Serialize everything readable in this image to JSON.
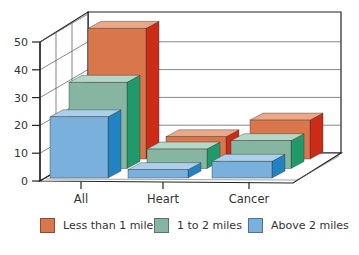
{
  "chart_data": {
    "type": "bar",
    "subtype": "3d-grouped",
    "title": "",
    "xlabel": "",
    "ylabel": "",
    "categories": [
      "All",
      "Heart",
      "Cancer"
    ],
    "y_ticks": [
      0,
      10,
      20,
      30,
      40,
      50
    ],
    "ylim": [
      0,
      50
    ],
    "grid": true,
    "legend_position": "bottom",
    "series": [
      {
        "name": "Less than 1 mile",
        "values": [
          47,
          8,
          14
        ],
        "color": "#d9764c",
        "top_color": "#eba886",
        "side_color": "#cc2b18"
      },
      {
        "name": "1 to 2 miles",
        "values": [
          31,
          7,
          10
        ],
        "color": "#86b6a2",
        "top_color": "#b5d7c8",
        "side_color": "#22996a"
      },
      {
        "name": "Above 2 miles",
        "values": [
          22,
          3,
          6
        ],
        "color": "#7ab0dc",
        "top_color": "#acd0ec",
        "side_color": "#2382c2"
      }
    ]
  },
  "legend": {
    "items": [
      {
        "label": "Less than 1 mile",
        "color": "#d9764c"
      },
      {
        "label": "1 to 2 miles",
        "color": "#86b6a2"
      },
      {
        "label": "Above 2 miles",
        "color": "#7ab0dc"
      }
    ]
  }
}
